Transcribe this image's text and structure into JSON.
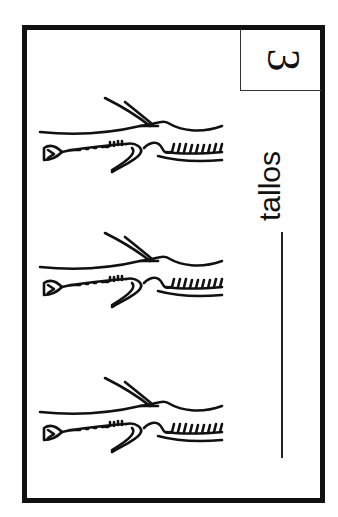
{
  "card": {
    "number": "3",
    "word": "tallos",
    "border_color": "#111111"
  },
  "illustrations": [
    {
      "name": "stem",
      "count_index": 1
    },
    {
      "name": "stem",
      "count_index": 2
    },
    {
      "name": "stem",
      "count_index": 3
    }
  ]
}
